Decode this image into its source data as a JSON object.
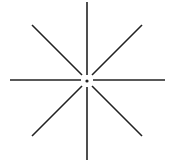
{
  "figure": {
    "name": "starburst",
    "stroke_color": "#222222",
    "background": "#ffffff",
    "center": {
      "x": 87,
      "y": 81
    },
    "center_dot_radius": 1.6,
    "rays": [
      {
        "name": "ray-up",
        "x1": 87,
        "y1": 75,
        "x2": 87,
        "y2": 2
      },
      {
        "name": "ray-down",
        "x1": 87,
        "y1": 87,
        "x2": 87,
        "y2": 160
      },
      {
        "name": "ray-left",
        "x1": 81,
        "y1": 80,
        "x2": 10,
        "y2": 80
      },
      {
        "name": "ray-right",
        "x1": 93,
        "y1": 80,
        "x2": 165,
        "y2": 80
      },
      {
        "name": "ray-up-left",
        "x1": 82,
        "y1": 75,
        "x2": 32,
        "y2": 25
      },
      {
        "name": "ray-up-right",
        "x1": 92,
        "y1": 75,
        "x2": 142,
        "y2": 25
      },
      {
        "name": "ray-down-left",
        "x1": 82,
        "y1": 86,
        "x2": 32,
        "y2": 136
      },
      {
        "name": "ray-down-right",
        "x1": 92,
        "y1": 86,
        "x2": 142,
        "y2": 136
      }
    ]
  }
}
